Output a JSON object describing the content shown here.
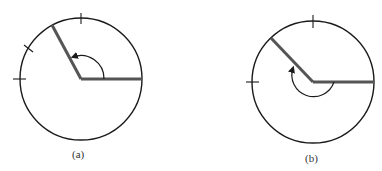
{
  "figures": [
    {
      "id": "a",
      "caption": "(a)",
      "description": "Circle with angle of about 120 degrees measured counterclockwise from the positive x-axis",
      "angle_deg": 120,
      "direction": "counterclockwise",
      "tick_marks_deg": [
        90,
        150,
        180
      ]
    },
    {
      "id": "b",
      "caption": "(b)",
      "description": "Circle with negative angle of about -225 degrees measured clockwise from the positive x-axis",
      "angle_deg": -225,
      "direction": "clockwise",
      "tick_marks_deg": [
        90,
        180
      ]
    }
  ],
  "colors": {
    "circle": "#1a1a1a",
    "ray": "#555555",
    "arc": "#1a1a1a",
    "caption": "#333333"
  }
}
